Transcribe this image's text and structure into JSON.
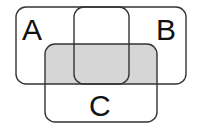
{
  "diagram": {
    "type": "venn",
    "shape": "rounded-rectangle",
    "sets": [
      {
        "label": "A",
        "x": 16,
        "y": 7,
        "w": 113,
        "h": 77,
        "label_x": 22,
        "label_y": 40
      },
      {
        "label": "B",
        "x": 74,
        "y": 7,
        "w": 112,
        "h": 77,
        "label_x": 156,
        "label_y": 40
      },
      {
        "label": "C",
        "x": 45,
        "y": 44,
        "w": 112,
        "h": 78,
        "label_x": 89,
        "label_y": 116
      }
    ],
    "shaded_region": {
      "description": "(A ∪ B) ∩ C",
      "x": 45,
      "y": 44,
      "w": 112,
      "h": 40
    },
    "colors": {
      "stroke": "#333333",
      "shade": "#d6d6d6",
      "background": "#ffffff"
    }
  }
}
